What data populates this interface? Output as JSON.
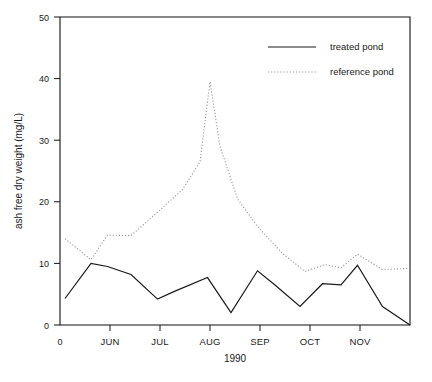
{
  "chart_data": {
    "type": "line",
    "title": "",
    "xlabel": "1990",
    "ylabel": "ash free dry weight (mg/L)",
    "ylim": [
      0,
      50
    ],
    "yticks": [
      0,
      10,
      20,
      30,
      40,
      50
    ],
    "ytick_labels": [
      "0",
      "10",
      "20",
      "30",
      "40",
      "50"
    ],
    "xlim": [
      0,
      7
    ],
    "xticks": [
      0,
      1,
      2,
      3,
      4,
      5,
      6
    ],
    "xtick_labels": [
      "0",
      "JUN",
      "JUL",
      "AUG",
      "SEP",
      "OCT",
      "NOV"
    ],
    "grid": false,
    "legend_position": "top-right",
    "series": [
      {
        "name": "treated pond",
        "style": "solid",
        "color": "#1a1a1a",
        "x": [
          0.1,
          0.62,
          0.95,
          1.42,
          1.95,
          2.3,
          2.95,
          3.42,
          3.95,
          4.3,
          4.8,
          5.25,
          5.62,
          5.95,
          6.45,
          7.0
        ],
        "values": [
          4.3,
          10.0,
          9.5,
          8.2,
          4.2,
          5.5,
          7.7,
          2.0,
          8.8,
          6.5,
          3.0,
          6.7,
          6.5,
          9.7,
          3.0,
          0.0
        ]
      },
      {
        "name": "reference pond",
        "style": "dotted",
        "color": "#9a9a9a",
        "x": [
          0.1,
          0.62,
          0.95,
          1.42,
          1.95,
          2.45,
          2.8,
          3.0,
          3.2,
          3.55,
          3.95,
          4.45,
          4.9,
          5.3,
          5.62,
          5.95,
          6.45,
          7.0
        ],
        "values": [
          14.0,
          10.6,
          14.6,
          14.5,
          18.3,
          22.0,
          26.5,
          39.5,
          29.0,
          20.5,
          16.0,
          11.6,
          8.7,
          9.8,
          9.3,
          11.5,
          9.0,
          9.2
        ]
      }
    ],
    "legend_entries": [
      {
        "label": "treated pond",
        "style": "solid"
      },
      {
        "label": "reference pond",
        "style": "dotted"
      }
    ]
  }
}
